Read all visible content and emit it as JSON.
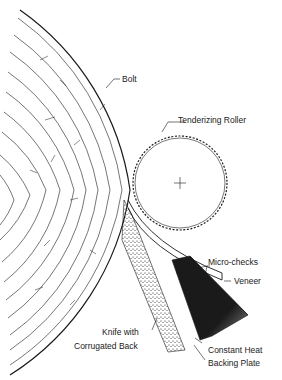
{
  "figure": {
    "type": "rotary veneer lathe cross-section",
    "labels": {
      "bolt": "Bolt",
      "roller": "Tenderizing Roller",
      "micro_checks": "Micro-checks",
      "veneer": "Veneer",
      "knife_line1": "Knife with",
      "knife_line2": "Corrugated Back",
      "backing_line1": "Constant Heat",
      "backing_line2": "Backing Plate"
    },
    "colors": {
      "ink": "#1a1a1a",
      "background": "#ffffff"
    }
  }
}
